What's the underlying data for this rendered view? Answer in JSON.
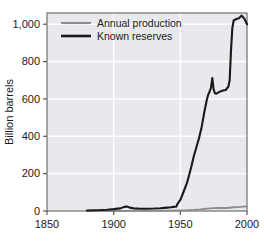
{
  "chart_data": {
    "type": "line",
    "title": "",
    "xlabel": "",
    "ylabel": "Billion barrels",
    "xlim": [
      1850,
      2000
    ],
    "ylim": [
      0,
      1060
    ],
    "xticks": [
      1850,
      1900,
      1950,
      2000
    ],
    "xtick_labels": [
      "1850",
      "1900",
      "1950",
      "2000"
    ],
    "yticks": [
      0,
      200,
      400,
      600,
      800,
      1000
    ],
    "ytick_labels": [
      "0",
      "200",
      "400",
      "600",
      "800",
      "1,000"
    ],
    "grid": true,
    "grid_color": "#ffffff",
    "plot_bg": "#e8e9ec",
    "legend_position": "top-left",
    "series": [
      {
        "name": "Annual production",
        "color": "#8c8c8c",
        "x": [
          1880,
          1890,
          1900,
          1910,
          1920,
          1930,
          1940,
          1945,
          1950,
          1955,
          1960,
          1965,
          1970,
          1975,
          1980,
          1985,
          1990,
          1995,
          2000
        ],
        "values": [
          0,
          0,
          0,
          1,
          1,
          1,
          2,
          2,
          3,
          4,
          6,
          9,
          13,
          15,
          17,
          16,
          20,
          22,
          25
        ]
      },
      {
        "name": "Known reserves",
        "color": "#1a1a1a",
        "x": [
          1880,
          1885,
          1890,
          1895,
          1900,
          1905,
          1908,
          1910,
          1912,
          1915,
          1920,
          1925,
          1930,
          1935,
          1940,
          1943,
          1945,
          1947,
          1948,
          1950,
          1952,
          1955,
          1958,
          1960,
          1962,
          1964,
          1966,
          1968,
          1970,
          1971,
          1972,
          1973,
          1974,
          1975,
          1976,
          1977,
          1978,
          1980,
          1982,
          1984,
          1986,
          1987,
          1988,
          1989,
          1990,
          1992,
          1994,
          1996,
          1998,
          2000
        ],
        "values": [
          3,
          4,
          5,
          7,
          10,
          14,
          22,
          24,
          18,
          14,
          12,
          12,
          13,
          15,
          18,
          20,
          22,
          24,
          40,
          60,
          95,
          150,
          230,
          290,
          340,
          390,
          450,
          530,
          600,
          625,
          640,
          660,
          712,
          650,
          630,
          628,
          632,
          640,
          645,
          648,
          665,
          700,
          860,
          980,
          1020,
          1028,
          1032,
          1046,
          1030,
          1000
        ]
      }
    ]
  },
  "legend": {
    "items": [
      {
        "label": "Annual production",
        "color": "#8c8c8c"
      },
      {
        "label": "Known reserves",
        "color": "#1a1a1a"
      }
    ]
  },
  "axes": {
    "y_title": "Billion barrels"
  }
}
